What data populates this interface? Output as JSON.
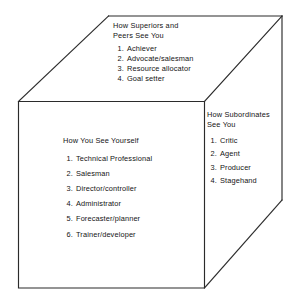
{
  "figure": {
    "name": "Role perception cube",
    "shape": "cube",
    "line_color": "#2b2b2b",
    "background_color": "#ffffff"
  },
  "faces": {
    "top": {
      "heading_line1": "How Superiors and",
      "heading_line2": "Peers See You",
      "items": [
        {
          "num": "1.",
          "text": "Achiever"
        },
        {
          "num": "2.",
          "text": "Advocate/salesman"
        },
        {
          "num": "3.",
          "text": "Resource allocator"
        },
        {
          "num": "4.",
          "text": "Goal setter"
        }
      ]
    },
    "front": {
      "heading_line1": "How You See Yourself",
      "items": [
        {
          "num": "1.",
          "text": "Technical Professional"
        },
        {
          "num": "2.",
          "text": "Salesman"
        },
        {
          "num": "3.",
          "text": "Director/controller"
        },
        {
          "num": "4.",
          "text": "Administrator"
        },
        {
          "num": "5.",
          "text": "Forecaster/planner"
        },
        {
          "num": "6.",
          "text": "Trainer/developer"
        }
      ]
    },
    "right": {
      "heading_line1": "How Subordinates",
      "heading_line2": "See You",
      "items": [
        {
          "num": "1.",
          "text": "Critic"
        },
        {
          "num": "2.",
          "text": "Agent"
        },
        {
          "num": "3.",
          "text": "Producer"
        },
        {
          "num": "4.",
          "text": "Stagehand"
        }
      ]
    }
  }
}
